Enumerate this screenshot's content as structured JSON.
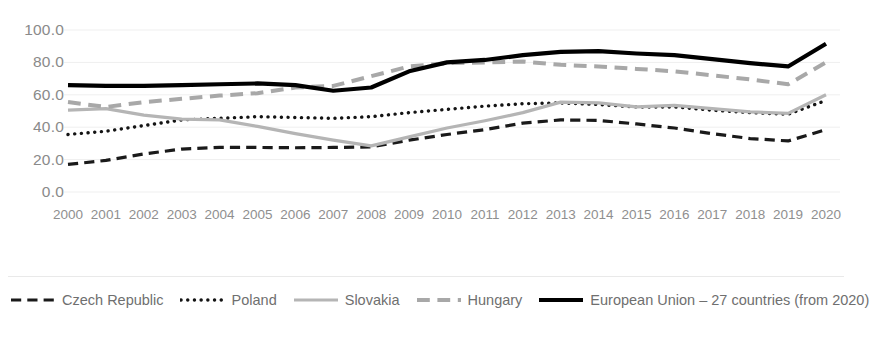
{
  "chart_data": {
    "type": "line",
    "title": "",
    "xlabel": "",
    "ylabel": "",
    "ylim": [
      0,
      100
    ],
    "ytick_labels": [
      "100.0",
      "80.0",
      "60.0",
      "40.0",
      "20.0",
      "0.0"
    ],
    "ytick_values": [
      100,
      80,
      60,
      40,
      20,
      0
    ],
    "grid": true,
    "legend_position": "bottom",
    "categories": [
      "2000",
      "2001",
      "2002",
      "2003",
      "2004",
      "2005",
      "2006",
      "2007",
      "2008",
      "2009",
      "2010",
      "2011",
      "2012",
      "2013",
      "2014",
      "2015",
      "2016",
      "2017",
      "2018",
      "2019",
      "2020"
    ],
    "series": [
      {
        "name": "Czech Republic",
        "style": "dashed",
        "color": "#1a1a1a",
        "width": 3.2,
        "values": [
          17.0,
          19.5,
          23.5,
          26.5,
          27.5,
          27.5,
          27.3,
          27.5,
          27.8,
          32.0,
          35.5,
          38.5,
          42.5,
          44.5,
          44.2,
          42.0,
          39.5,
          36.0,
          33.0,
          31.5,
          38.5
        ]
      },
      {
        "name": "Poland",
        "style": "dotted",
        "color": "#141414",
        "width": 3.4,
        "values": [
          35.5,
          37.5,
          41.0,
          44.5,
          45.5,
          46.5,
          46.0,
          45.5,
          46.5,
          49.0,
          51.0,
          53.0,
          54.5,
          55.0,
          54.0,
          52.5,
          52.5,
          50.5,
          49.0,
          48.0,
          56.5
        ]
      },
      {
        "name": "Slovakia",
        "style": "solid",
        "color": "#b5b5b5",
        "width": 3.2,
        "values": [
          50.5,
          51.5,
          47.5,
          45.0,
          44.5,
          40.5,
          36.0,
          32.0,
          28.5,
          34.0,
          39.5,
          44.0,
          49.0,
          55.5,
          55.0,
          52.5,
          53.5,
          51.5,
          49.5,
          48.5,
          60.0
        ]
      },
      {
        "name": "Hungary",
        "style": "dashed",
        "color": "#a8a8a8",
        "width": 4.0,
        "values": [
          55.5,
          52.5,
          55.5,
          57.5,
          59.5,
          61.0,
          64.5,
          65.5,
          71.5,
          77.5,
          79.5,
          80.0,
          80.5,
          78.5,
          77.5,
          76.0,
          74.5,
          72.0,
          69.5,
          66.5,
          80.0
        ]
      },
      {
        "name": "European Union – 27 countries (from 2020)",
        "style": "solid",
        "color": "#000000",
        "width": 4.2,
        "values": [
          66.0,
          65.5,
          65.5,
          66.0,
          66.5,
          67.0,
          66.0,
          62.5,
          64.5,
          74.5,
          80.0,
          81.5,
          84.5,
          86.5,
          87.0,
          85.5,
          84.5,
          82.0,
          79.5,
          77.5,
          91.5
        ]
      }
    ]
  },
  "legend": {
    "items": [
      {
        "label": "Czech Republic"
      },
      {
        "label": "Poland"
      },
      {
        "label": "Slovakia"
      },
      {
        "label": "Hungary"
      },
      {
        "label": "European Union – 27 countries (from 2020)"
      }
    ]
  }
}
